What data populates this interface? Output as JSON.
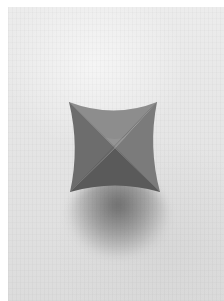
{
  "image": {
    "description": "Grayscale photograph of a four-pointed folded paper star resting on a textured white surface, casting a soft shadow below it",
    "subject": "four-pointed paper star",
    "colors": {
      "background": "#e6e6e6",
      "facet_top": "#8a8a8a",
      "facet_left": "#6e6e6e",
      "facet_right": "#7a7a7a",
      "facet_bottom": "#5c5c5c",
      "shadow": "#555555"
    }
  }
}
